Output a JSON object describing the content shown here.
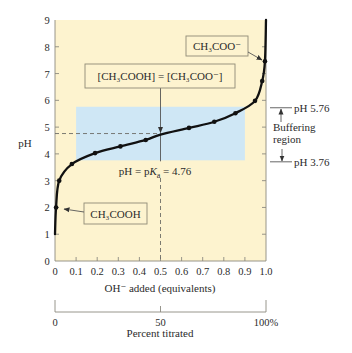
{
  "figure": {
    "background": "#ffffff",
    "plot_bg_color": "#fdf3cf",
    "buffer_color": "#cfe7f5",
    "curve_color": "#111111"
  },
  "chart_data": {
    "type": "line",
    "title": "",
    "xlabel": "OH⁻ added (equivalents)",
    "ylabel": "pH",
    "xlim": [
      0,
      1.0
    ],
    "ylim": [
      0,
      9
    ],
    "x_ticks": [
      0,
      0.1,
      0.2,
      0.3,
      0.4,
      0.5,
      0.6,
      0.7,
      0.8,
      0.9,
      1.0
    ],
    "x_tick_labels": [
      "0",
      "0.1",
      "0.2",
      "0.3",
      "0.4",
      "0.5",
      "0.6",
      "0.7",
      "0.8",
      "0.9",
      "1.0"
    ],
    "y_ticks": [
      0,
      1,
      2,
      3,
      4,
      5,
      6,
      7,
      8,
      9
    ],
    "y_tick_labels": [
      "0",
      "1",
      "2",
      "3",
      "4",
      "5",
      "6",
      "7",
      "8",
      "9"
    ],
    "grid": false,
    "legend": null,
    "series": [
      {
        "name": "Titration curve of acetic acid",
        "x": [
          0,
          0.005,
          0.02,
          0.08,
          0.19,
          0.31,
          0.43,
          0.5,
          0.635,
          0.755,
          0.855,
          0.948,
          0.982,
          0.995,
          1.0
        ],
        "y": [
          1.0,
          2.0,
          3.0,
          3.62,
          4.03,
          4.28,
          4.52,
          4.72,
          4.97,
          5.2,
          5.52,
          5.98,
          6.72,
          7.46,
          9.0
        ]
      }
    ],
    "markers": {
      "x": [
        0.005,
        0.02,
        0.08,
        0.19,
        0.31,
        0.43,
        0.635,
        0.755,
        0.855,
        0.948,
        0.982,
        0.995
      ],
      "y": [
        2.0,
        3.0,
        3.62,
        4.03,
        4.28,
        4.52,
        4.97,
        5.2,
        5.52,
        5.98,
        6.72,
        7.46
      ]
    },
    "shaded_region": {
      "label": "Buffering region",
      "x": [
        0.1,
        0.9
      ],
      "y": [
        3.76,
        5.76
      ]
    },
    "reference_lines": {
      "pka_y": 4.76,
      "midpoint_x": 0.5
    },
    "secondary_x_axis": {
      "label": "Percent titrated",
      "positions": [
        0,
        0.5,
        1.0
      ],
      "tick_labels": [
        "0",
        "50",
        "100%"
      ]
    },
    "annotations": {
      "acid": "CH₃COOH",
      "acetate": "CH₃COO⁻",
      "equality": "[CH₃COOH] = [CH₃COO⁻]",
      "pka": {
        "prefix": "pH = p",
        "k": "K",
        "sub": "a",
        "suffix": " = 4.76"
      },
      "buffer_upper": "pH 5.76",
      "buffer_lower": "pH 3.76",
      "buffer_label_line1": "Buffering",
      "buffer_label_line2": "region"
    }
  }
}
